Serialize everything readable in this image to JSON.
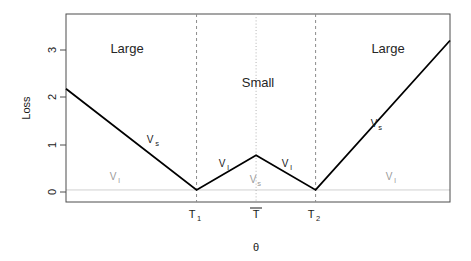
{
  "chart_data": {
    "type": "line",
    "title": "",
    "xlabel": "θ",
    "ylabel": "Loss",
    "ylim": [
      -0.25,
      3.65
    ],
    "yticks": [
      0,
      1,
      2,
      3
    ],
    "ytick_labels": [
      "0",
      "1",
      "2",
      "3"
    ],
    "xlim": [
      0,
      10
    ],
    "xticks": [
      3.4,
      4.95,
      6.5
    ],
    "xtick_labels": [
      "T₁",
      "T̄",
      "T₂"
    ],
    "grid": false,
    "legend": "none",
    "series": [
      {
        "name": "Loss",
        "x": [
          0,
          3.4,
          4.95,
          6.5,
          10
        ],
        "y": [
          2.1,
          0.0,
          0.72,
          0.0,
          3.1
        ]
      }
    ],
    "vertical_lines": [
      {
        "x": 3.4,
        "style": "dashed",
        "color": "#8c8c8c",
        "label": "T₁"
      },
      {
        "x": 4.95,
        "style": "dotted",
        "color": "#b3b3b3",
        "label": "T̄"
      },
      {
        "x": 6.5,
        "style": "dashed",
        "color": "#8c8c8c",
        "label": "T₂"
      }
    ],
    "region_labels": [
      {
        "text": "Large",
        "x": 1.6,
        "y": 3.05
      },
      {
        "text": "Small",
        "x": 5.0,
        "y": 2.35
      },
      {
        "text": "Large",
        "x": 8.4,
        "y": 3.05
      }
    ],
    "annotations": [
      {
        "text": "V",
        "sub": "s",
        "color": "dark",
        "x": 2.2,
        "y": 1.08
      },
      {
        "text": "V",
        "sub": "l",
        "color": "grey",
        "x": 1.15,
        "y": 0.3
      },
      {
        "text": "V",
        "sub": "l",
        "color": "dark",
        "x": 4.05,
        "y": 0.58
      },
      {
        "text": "V",
        "sub": "s",
        "color": "grey",
        "x": 4.95,
        "y": 0.22
      },
      {
        "text": "V",
        "sub": "l",
        "color": "dark",
        "x": 5.85,
        "y": 0.58
      },
      {
        "text": "V",
        "sub": "s",
        "color": "dark",
        "x": 8.05,
        "y": 1.52
      },
      {
        "text": "V",
        "sub": "l",
        "color": "grey",
        "x": 8.6,
        "y": 0.3
      }
    ]
  },
  "axes": {
    "y_label": "Loss",
    "x_label": "θ",
    "y_tick_0": "0",
    "y_tick_1": "1",
    "y_tick_2": "2",
    "y_tick_3": "3",
    "x_tick_t1_base": "T",
    "x_tick_t1_sub": "1",
    "x_tick_tbar": "T",
    "x_tick_t2_base": "T",
    "x_tick_t2_sub": "2"
  },
  "regions": {
    "left_label": "Large",
    "middle_label": "Small",
    "right_label": "Large"
  },
  "annotations": {
    "v_base": "V",
    "sub_s": "s",
    "sub_l": "l"
  },
  "colors": {
    "line": "#000000",
    "axis": "#4d4d4d",
    "dashed_guide": "#8c8c8c",
    "dotted_guide": "#b3b3b3",
    "grey_text": "#9a9a9a",
    "dark_text": "#1a1a1a",
    "background": "#ffffff"
  }
}
